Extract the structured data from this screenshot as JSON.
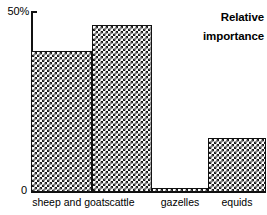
{
  "chart_data": {
    "type": "bar",
    "title": "",
    "annotation": "Relative importance",
    "annotation_lines": [
      "Relative",
      "importance"
    ],
    "categories": [
      "sheep and goats",
      "cattle",
      "gazelles",
      "equids"
    ],
    "values": [
      39,
      46,
      1,
      15
    ],
    "xlabel": "",
    "ylabel": "",
    "ylim": [
      0,
      50
    ],
    "ytick_labels": [
      "0",
      "50%"
    ],
    "ytick_values": [
      0,
      50
    ],
    "grid": false,
    "legend": false,
    "bar_fill": "checkerboard-pattern",
    "bar_outline_color": "#111111",
    "axis_color": "#111111",
    "background_color": "#ffffff"
  },
  "axis": {
    "y_top_label": "50%",
    "y_zero_label": "0"
  }
}
